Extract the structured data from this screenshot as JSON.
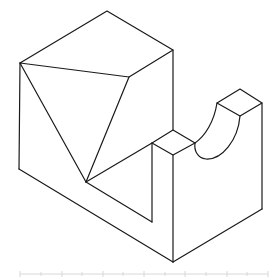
{
  "figure": {
    "type": "isometric-technical-drawing",
    "stroke_color": "#1a1a1a",
    "background": "#ffffff"
  },
  "ruler": {
    "color": "#d8d8d8",
    "y": 274,
    "x_start": 20,
    "x_end": 268,
    "ticks": [
      20,
      41,
      62,
      82,
      103,
      123,
      144,
      165,
      185,
      206,
      227,
      247,
      268
    ]
  }
}
